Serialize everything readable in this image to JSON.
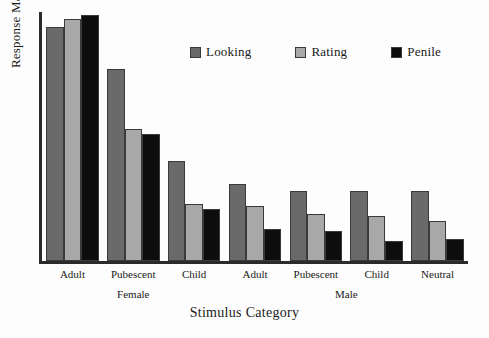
{
  "chart_data": {
    "type": "bar",
    "title": "",
    "xlabel": "Stimulus Category",
    "ylabel": "Response Magnitude",
    "categories": [
      "Adult",
      "Pubescent",
      "Child",
      "Adult",
      "Pubescent",
      "Child",
      "Neutral"
    ],
    "group_labels": [
      "Female",
      "Male"
    ],
    "group_spans": [
      [
        0,
        2
      ],
      [
        3,
        6
      ]
    ],
    "series": [
      {
        "name": "Looking",
        "color": "#6a6a6a",
        "values": [
          94,
          77,
          40,
          31,
          28,
          28,
          28
        ]
      },
      {
        "name": "Rating",
        "color": "#a8a8a8",
        "values": [
          97,
          53,
          23,
          22,
          19,
          18,
          16
        ]
      },
      {
        "name": "Penile",
        "color": "#0d0d0d",
        "values": [
          99,
          51,
          21,
          13,
          12,
          8,
          9
        ]
      }
    ],
    "ylim": [
      0,
      100
    ],
    "yticks": [],
    "grid": false,
    "legend_position": "top-center",
    "axis_color": "#2b2b2b"
  },
  "legend": {
    "items": [
      {
        "label": "Looking",
        "swatch_name": "legend-swatch-looking"
      },
      {
        "label": "Rating",
        "swatch_name": "legend-swatch-rating"
      },
      {
        "label": "Penile",
        "swatch_name": "legend-swatch-penile"
      }
    ]
  },
  "axes": {
    "y_title": "Response Magnitude",
    "x_title": "Stimulus Category"
  }
}
